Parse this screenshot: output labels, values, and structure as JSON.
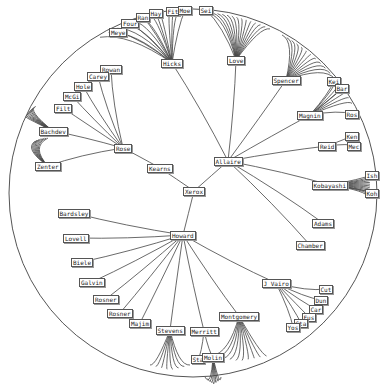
{
  "diagram": {
    "type": "radial-hyperbolic-tree",
    "boundary": {
      "cx": 193,
      "cy": 193,
      "r": 184
    },
    "colors": {
      "edge": "#444444",
      "node_border": "#555555",
      "background": "#ffffff"
    },
    "root": "xerox",
    "nodes": [
      {
        "id": "xerox",
        "label": "Xerox",
        "x": 194,
        "y": 191,
        "parent": null
      },
      {
        "id": "allaire",
        "label": "Allaire",
        "x": 228,
        "y": 161,
        "parent": "xerox"
      },
      {
        "id": "kearns",
        "label": "Kearns",
        "x": 160,
        "y": 168,
        "parent": "xerox"
      },
      {
        "id": "howard",
        "label": "Howard",
        "x": 183,
        "y": 235,
        "parent": "xerox"
      },
      {
        "id": "rose",
        "label": "Rose",
        "x": 123,
        "y": 148,
        "parent": "kearns"
      },
      {
        "id": "rowan",
        "label": "Rowan",
        "x": 111,
        "y": 69,
        "parent": "rose"
      },
      {
        "id": "carey",
        "label": "Carey",
        "x": 98,
        "y": 76,
        "parent": "rose"
      },
      {
        "id": "hole",
        "label": "Hole",
        "x": 83,
        "y": 86,
        "parent": "rose"
      },
      {
        "id": "mcgi",
        "label": "McGi",
        "x": 72,
        "y": 96,
        "parent": "rose"
      },
      {
        "id": "filt",
        "label": "Filt",
        "x": 63,
        "y": 108,
        "parent": "rose"
      },
      {
        "id": "bachdev",
        "label": "Bachdev",
        "x": 53,
        "y": 131,
        "parent": "rose"
      },
      {
        "id": "zenter",
        "label": "Zenter",
        "x": 48,
        "y": 166,
        "parent": "rose"
      },
      {
        "id": "hicks",
        "label": "Hicks",
        "x": 172,
        "y": 63,
        "parent": "allaire"
      },
      {
        "id": "meye",
        "label": "Meye",
        "x": 118,
        "y": 32,
        "parent": "hicks"
      },
      {
        "id": "four",
        "label": "Four",
        "x": 130,
        "y": 23,
        "parent": "hicks"
      },
      {
        "id": "ran",
        "label": "Ran",
        "x": 143,
        "y": 17,
        "parent": "hicks"
      },
      {
        "id": "hay",
        "label": "Hay",
        "x": 156,
        "y": 13,
        "parent": "hicks"
      },
      {
        "id": "fit",
        "label": "Fit",
        "x": 173,
        "y": 11,
        "parent": "hicks"
      },
      {
        "id": "moe",
        "label": "Moe",
        "x": 185,
        "y": 10,
        "parent": "hicks"
      },
      {
        "id": "love",
        "label": "Love",
        "x": 236,
        "y": 60,
        "parent": "allaire"
      },
      {
        "id": "sei",
        "label": "Sei",
        "x": 206,
        "y": 10,
        "parent": "love"
      },
      {
        "id": "spencer",
        "label": "Spencer",
        "x": 286,
        "y": 80,
        "parent": "allaire"
      },
      {
        "id": "magnin",
        "label": "Magnin",
        "x": 310,
        "y": 115,
        "parent": "allaire"
      },
      {
        "id": "kei",
        "label": "Kei",
        "x": 334,
        "y": 81,
        "parent": "magnin"
      },
      {
        "id": "bar",
        "label": "Bar",
        "x": 342,
        "y": 88,
        "parent": "magnin"
      },
      {
        "id": "ros",
        "label": "Ros",
        "x": 352,
        "y": 114,
        "parent": "magnin"
      },
      {
        "id": "reid",
        "label": "Reid",
        "x": 327,
        "y": 146,
        "parent": "allaire"
      },
      {
        "id": "ken",
        "label": "Ken",
        "x": 352,
        "y": 136,
        "parent": "reid"
      },
      {
        "id": "mec",
        "label": "Mec",
        "x": 354,
        "y": 146,
        "parent": "reid"
      },
      {
        "id": "kobayashi",
        "label": "Kobayashi",
        "x": 330,
        "y": 185,
        "parent": "allaire"
      },
      {
        "id": "ish",
        "label": "Ish",
        "x": 372,
        "y": 175,
        "parent": "kobayashi"
      },
      {
        "id": "koh",
        "label": "Koh",
        "x": 372,
        "y": 193,
        "parent": "kobayashi"
      },
      {
        "id": "adams",
        "label": "Adams",
        "x": 323,
        "y": 223,
        "parent": "allaire"
      },
      {
        "id": "chamber",
        "label": "Chamber",
        "x": 310,
        "y": 245,
        "parent": "allaire"
      },
      {
        "id": "bardsley",
        "label": "Bardsley",
        "x": 74,
        "y": 213,
        "parent": "howard"
      },
      {
        "id": "lovell",
        "label": "Lovell",
        "x": 76,
        "y": 238,
        "parent": "howard"
      },
      {
        "id": "biele",
        "label": "Biele",
        "x": 82,
        "y": 262,
        "parent": "howard"
      },
      {
        "id": "galvin",
        "label": "Galvin",
        "x": 92,
        "y": 282,
        "parent": "howard"
      },
      {
        "id": "rosner1",
        "label": "Rosner",
        "x": 106,
        "y": 299,
        "parent": "howard"
      },
      {
        "id": "rosner2",
        "label": "Rosner",
        "x": 120,
        "y": 313,
        "parent": "howard"
      },
      {
        "id": "majim",
        "label": "Majim",
        "x": 140,
        "y": 323,
        "parent": "howard"
      },
      {
        "id": "stevens",
        "label": "Stevens",
        "x": 170,
        "y": 330,
        "parent": "howard"
      },
      {
        "id": "merritt",
        "label": "Merritt",
        "x": 204,
        "y": 331,
        "parent": "howard"
      },
      {
        "id": "sta",
        "label": "Sta",
        "x": 198,
        "y": 359,
        "parent": "merritt"
      },
      {
        "id": "molin",
        "label": "Molin",
        "x": 213,
        "y": 357,
        "parent": "merritt"
      },
      {
        "id": "montgomery",
        "label": "Montgomery",
        "x": 239,
        "y": 316,
        "parent": "howard"
      },
      {
        "id": "jvairo",
        "label": "J Vairo",
        "x": 276,
        "y": 283,
        "parent": "howard"
      },
      {
        "id": "cut",
        "label": "Cut",
        "x": 326,
        "y": 289,
        "parent": "jvairo"
      },
      {
        "id": "dun",
        "label": "Dun",
        "x": 321,
        "y": 300,
        "parent": "jvairo"
      },
      {
        "id": "car",
        "label": "Car",
        "x": 316,
        "y": 309,
        "parent": "jvairo"
      },
      {
        "id": "fus",
        "label": "Fus",
        "x": 309,
        "y": 317,
        "parent": "jvairo"
      },
      {
        "id": "sta2",
        "label": "Sta",
        "x": 301,
        "y": 323,
        "parent": "jvairo"
      },
      {
        "id": "yos",
        "label": "Yos",
        "x": 293,
        "y": 327,
        "parent": "jvairo"
      }
    ],
    "leaf_fans": [
      {
        "parent": "hicks",
        "count": 10,
        "start": 100,
        "end": 178,
        "radius": 180
      },
      {
        "parent": "love",
        "count": 14,
        "start": 208,
        "end": 270,
        "radius": 180
      },
      {
        "parent": "spencer",
        "count": 12,
        "start": 282,
        "end": 335,
        "radius": 178
      },
      {
        "parent": "magnin",
        "count": 6,
        "start": 335,
        "end": 352,
        "radius": 178
      },
      {
        "parent": "kobayashi",
        "count": 12,
        "start": 164,
        "end": 215,
        "radius": 170,
        "polar": true
      },
      {
        "parent": "bachdev",
        "count": 9,
        "start": 118,
        "end": 145,
        "radius": 30,
        "side": "left"
      },
      {
        "parent": "zenter",
        "count": 8,
        "start": 153,
        "end": 180,
        "radius": 28,
        "side": "left"
      },
      {
        "parent": "stevens",
        "count": 8,
        "spread": 40,
        "length": 40
      },
      {
        "parent": "molin",
        "count": 7,
        "spread": 16,
        "length": 25
      },
      {
        "parent": "montgomery",
        "count": 10,
        "spread": 55,
        "length": 45
      }
    ]
  }
}
